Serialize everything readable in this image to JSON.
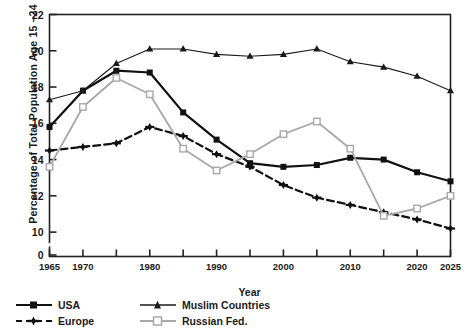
{
  "chart_data": {
    "type": "line",
    "title": "",
    "xlabel": "Year",
    "ylabel": "Percentage of Total Population Age 15 –24",
    "xlim": [
      1965,
      2025
    ],
    "ylim": [
      9.4,
      22
    ],
    "ytick_labels": [
      "22",
      "20",
      "18",
      "16",
      "14",
      "12",
      "10",
      "0"
    ],
    "ytick_values": [
      22,
      20,
      18,
      16,
      14,
      12,
      10,
      0
    ],
    "axis_break": true,
    "xtick_values": [
      1965,
      1970,
      1975,
      1980,
      1985,
      1990,
      1995,
      2000,
      2005,
      2010,
      2015,
      2020,
      2025
    ],
    "xtick_labels": [
      "1965",
      "1970",
      "",
      "1980",
      "",
      "1990",
      "",
      "2000",
      "",
      "2010",
      "",
      "2020",
      "2025"
    ],
    "grid": false,
    "legend_position": "below-left",
    "x": [
      1965,
      1970,
      1975,
      1980,
      1985,
      1990,
      1995,
      2000,
      2005,
      2010,
      2015,
      2020,
      2025
    ],
    "series": [
      {
        "name": "USA",
        "color": "#111111",
        "marker": "square-filled",
        "dash": "solid",
        "width": 2.2,
        "values": [
          15.8,
          17.8,
          18.9,
          18.8,
          16.6,
          15.1,
          13.8,
          13.6,
          13.7,
          14.1,
          14.0,
          13.3,
          12.8
        ]
      },
      {
        "name": "Europe",
        "color": "#111111",
        "marker": "plus-filled",
        "dash": "dashed",
        "width": 2.2,
        "values": [
          14.5,
          14.7,
          14.9,
          15.8,
          15.3,
          14.3,
          13.6,
          12.6,
          11.9,
          11.5,
          11.1,
          10.7,
          10.2
        ]
      },
      {
        "name": "Muslim Countries",
        "color": "#1a1a1a",
        "marker": "triangle-filled",
        "dash": "solid",
        "width": 1.1,
        "values": [
          17.3,
          17.8,
          19.3,
          20.1,
          20.1,
          19.8,
          19.7,
          19.8,
          20.1,
          19.4,
          19.1,
          18.6,
          17.8
        ]
      },
      {
        "name": "Russian Fed.",
        "color": "#a8a8a8",
        "marker": "square-open",
        "dash": "solid",
        "width": 1.8,
        "values": [
          13.6,
          16.9,
          18.5,
          17.6,
          14.6,
          13.4,
          14.3,
          15.4,
          16.1,
          14.6,
          10.9,
          11.3,
          12.0
        ]
      }
    ]
  },
  "legend": {
    "items": [
      {
        "label": "USA"
      },
      {
        "label": "Europe"
      },
      {
        "label": "Muslim Countries"
      },
      {
        "label": "Russian Fed."
      }
    ]
  }
}
